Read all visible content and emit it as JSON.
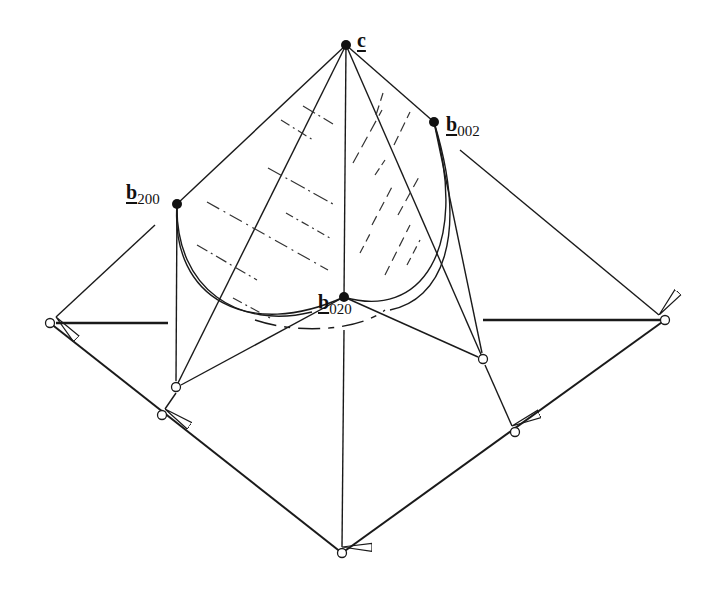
{
  "diagram": {
    "title": "",
    "colors": {
      "stroke": "#1a1a1a",
      "background": "#ffffff"
    },
    "labels": {
      "c": {
        "main": "c",
        "sub": ""
      },
      "b002": {
        "main": "b",
        "sub": "002"
      },
      "b200": {
        "main": "b",
        "sub": "200"
      },
      "b020": {
        "main": "b",
        "sub": "020"
      }
    },
    "points": {
      "c": [
        346,
        45
      ],
      "b002": [
        434,
        122
      ],
      "b200": [
        177,
        204
      ],
      "b020": [
        344,
        297
      ],
      "outer_left": [
        50,
        323
      ],
      "outer_right": [
        665,
        320
      ],
      "outer_bottom": [
        342,
        553
      ],
      "proj_left_inner": [
        176,
        387
      ],
      "proj_left_outer": [
        162,
        415
      ],
      "proj_right_inner": [
        483,
        359
      ],
      "proj_right_outer": [
        515,
        432
      ]
    }
  }
}
